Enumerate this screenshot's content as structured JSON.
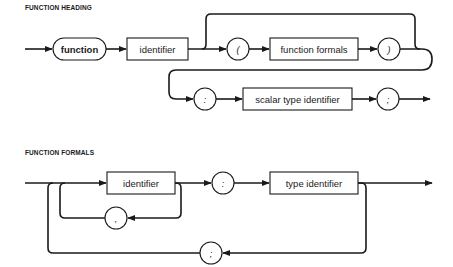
{
  "diagrams": [
    {
      "title": "FUNCTION HEADING",
      "nodes": {
        "keyword": "function",
        "identifier": "identifier",
        "open_paren": "(",
        "formals": "function formals",
        "close_paren": ")",
        "colon": ":",
        "scalar_type": "scalar type identifier",
        "semicolon": ";"
      }
    },
    {
      "title": "FUNCTION FORMALS",
      "nodes": {
        "identifier": "identifier",
        "comma": ",",
        "colon": ":",
        "type_identifier": "type identifier",
        "semicolon": ";"
      }
    }
  ],
  "colors": {
    "ink": "#1a1a1a",
    "background": "#ffffff"
  }
}
